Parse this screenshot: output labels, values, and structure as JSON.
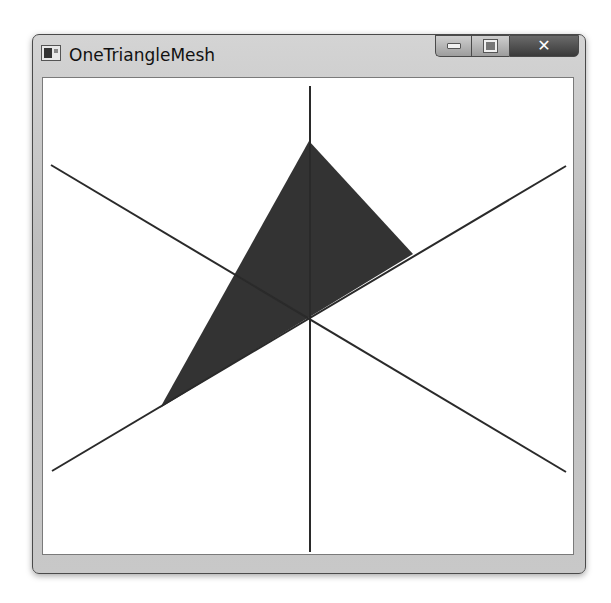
{
  "window": {
    "title": "OneTriangleMesh",
    "controls": {
      "minimize": "–",
      "maximize": "□",
      "close": "✕"
    }
  },
  "scene": {
    "fill_color": "#333333",
    "line_color": "#2a2a2a",
    "origin": [
      310,
      320
    ],
    "triangle": [
      [
        309,
        141
      ],
      [
        413,
        254
      ],
      [
        160,
        408
      ]
    ],
    "axes": [
      {
        "name": "vertical-axis",
        "from": [
          310,
          86
        ],
        "to": [
          310,
          552
        ]
      },
      {
        "name": "axis-upper-left-to-lower-right",
        "from": [
          51,
          165
        ],
        "to": [
          566,
          472
        ]
      },
      {
        "name": "axis-lower-left-to-upper-right",
        "from": [
          52,
          471
        ],
        "to": [
          566,
          166
        ]
      }
    ]
  }
}
